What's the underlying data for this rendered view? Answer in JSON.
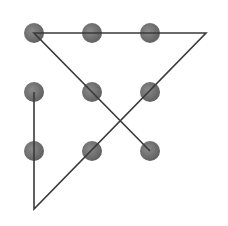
{
  "diagram": {
    "title": "",
    "canvas": {
      "width": 228,
      "height": 226,
      "background": "#ffffff"
    },
    "colors": {
      "dot_fill_center": "#8a8a8a",
      "dot_fill_edge": "#5e5e5e",
      "line": "#3a3a3a"
    },
    "dot_radius": 10,
    "line_width": 1.6,
    "dots": [
      {
        "id": "r1c1",
        "x": 34,
        "y": 33
      },
      {
        "id": "r1c2",
        "x": 92,
        "y": 33
      },
      {
        "id": "r1c3",
        "x": 150,
        "y": 33
      },
      {
        "id": "r2c1",
        "x": 34,
        "y": 92
      },
      {
        "id": "r2c2",
        "x": 92,
        "y": 92
      },
      {
        "id": "r2c3",
        "x": 150,
        "y": 92
      },
      {
        "id": "r3c1",
        "x": 34,
        "y": 151
      },
      {
        "id": "r3c2",
        "x": 92,
        "y": 151
      },
      {
        "id": "r3c3",
        "x": 150,
        "y": 151
      }
    ],
    "path": [
      {
        "x": 34,
        "y": 92
      },
      {
        "x": 34,
        "y": 209
      },
      {
        "x": 206,
        "y": 33
      },
      {
        "x": 34,
        "y": 33
      },
      {
        "x": 150,
        "y": 151
      }
    ]
  }
}
